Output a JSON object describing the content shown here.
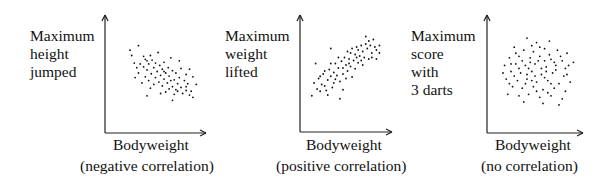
{
  "chart_data": [
    {
      "type": "scatter",
      "title": "",
      "ylabel": "Maximum height jumped",
      "ylabel_lines": [
        "Maximum",
        "height",
        "jumped"
      ],
      "xlabel": "Bodyweight",
      "caption": "(negative correlation)",
      "grid": false,
      "ticks": false,
      "trend": "negative",
      "points": [
        [
          0.3,
          0.86
        ],
        [
          0.53,
          0.77
        ],
        [
          0.22,
          0.73
        ],
        [
          0.38,
          0.68
        ],
        [
          0.46,
          0.67
        ],
        [
          0.6,
          0.64
        ],
        [
          0.25,
          0.63
        ],
        [
          0.32,
          0.62
        ],
        [
          0.42,
          0.62
        ],
        [
          0.55,
          0.6
        ],
        [
          0.65,
          0.57
        ],
        [
          0.8,
          0.56
        ],
        [
          0.28,
          0.57
        ],
        [
          0.36,
          0.58
        ],
        [
          0.48,
          0.57
        ],
        [
          0.58,
          0.55
        ],
        [
          0.7,
          0.53
        ],
        [
          0.4,
          0.54
        ],
        [
          0.52,
          0.52
        ],
        [
          0.62,
          0.5
        ],
        [
          0.74,
          0.5
        ],
        [
          0.86,
          0.48
        ],
        [
          0.3,
          0.5
        ],
        [
          0.45,
          0.49
        ],
        [
          0.56,
          0.47
        ],
        [
          0.66,
          0.46
        ],
        [
          0.78,
          0.44
        ],
        [
          0.38,
          0.45
        ],
        [
          0.5,
          0.44
        ],
        [
          0.6,
          0.42
        ],
        [
          0.72,
          0.41
        ],
        [
          0.84,
          0.4
        ],
        [
          0.42,
          0.4
        ],
        [
          0.54,
          0.38
        ],
        [
          0.64,
          0.37
        ],
        [
          0.76,
          0.36
        ],
        [
          0.88,
          0.36
        ],
        [
          0.48,
          0.35
        ],
        [
          0.58,
          0.33
        ],
        [
          0.7,
          0.32
        ],
        [
          0.8,
          0.31
        ],
        [
          0.66,
          0.29
        ],
        [
          0.74,
          0.28
        ],
        [
          0.86,
          0.27
        ],
        [
          0.92,
          0.26
        ],
        [
          0.62,
          0.25
        ],
        [
          0.82,
          0.23
        ],
        [
          0.72,
          0.22
        ],
        [
          0.9,
          0.21
        ],
        [
          0.56,
          0.23
        ],
        [
          0.44,
          0.3
        ],
        [
          0.34,
          0.37
        ],
        [
          0.26,
          0.44
        ],
        [
          0.98,
          0.35
        ],
        [
          0.94,
          0.45
        ],
        [
          0.9,
          0.55
        ],
        [
          0.78,
          0.66
        ],
        [
          0.68,
          0.7
        ],
        [
          0.2,
          0.8
        ],
        [
          0.4,
          0.2
        ],
        [
          0.7,
          0.14
        ],
        [
          0.36,
          0.72
        ],
        [
          0.44,
          0.73
        ],
        [
          0.5,
          0.63
        ],
        [
          0.68,
          0.4
        ],
        [
          0.76,
          0.26
        ],
        [
          0.6,
          0.52
        ],
        [
          0.86,
          0.32
        ],
        [
          0.94,
          0.18
        ],
        [
          0.4,
          0.66
        ]
      ]
    },
    {
      "type": "scatter",
      "title": "",
      "ylabel": "Maximum weight lifted",
      "ylabel_lines": [
        "Maximum",
        "weight",
        "lifted"
      ],
      "xlabel": "Bodyweight",
      "caption": "(positive correlation)",
      "grid": false,
      "ticks": false,
      "trend": "positive",
      "points": [
        [
          0.3,
          0.82
        ],
        [
          0.1,
          0.62
        ],
        [
          0.42,
          0.15
        ],
        [
          0.46,
          0.27
        ],
        [
          0.05,
          0.19
        ],
        [
          0.08,
          0.36
        ],
        [
          0.16,
          0.25
        ],
        [
          0.22,
          0.32
        ],
        [
          0.26,
          0.4
        ],
        [
          0.14,
          0.42
        ],
        [
          0.2,
          0.48
        ],
        [
          0.3,
          0.45
        ],
        [
          0.36,
          0.41
        ],
        [
          0.42,
          0.38
        ],
        [
          0.28,
          0.54
        ],
        [
          0.34,
          0.5
        ],
        [
          0.4,
          0.56
        ],
        [
          0.46,
          0.48
        ],
        [
          0.52,
          0.52
        ],
        [
          0.36,
          0.62
        ],
        [
          0.44,
          0.65
        ],
        [
          0.5,
          0.6
        ],
        [
          0.56,
          0.58
        ],
        [
          0.62,
          0.55
        ],
        [
          0.48,
          0.7
        ],
        [
          0.54,
          0.68
        ],
        [
          0.6,
          0.66
        ],
        [
          0.66,
          0.63
        ],
        [
          0.72,
          0.6
        ],
        [
          0.56,
          0.76
        ],
        [
          0.62,
          0.74
        ],
        [
          0.68,
          0.72
        ],
        [
          0.74,
          0.7
        ],
        [
          0.8,
          0.68
        ],
        [
          0.66,
          0.8
        ],
        [
          0.72,
          0.78
        ],
        [
          0.78,
          0.82
        ],
        [
          0.84,
          0.76
        ],
        [
          0.9,
          0.8
        ],
        [
          0.7,
          0.86
        ],
        [
          0.76,
          0.88
        ],
        [
          0.82,
          0.86
        ],
        [
          0.88,
          0.84
        ],
        [
          0.8,
          0.92
        ],
        [
          0.86,
          0.94
        ],
        [
          0.94,
          0.86
        ],
        [
          0.76,
          0.98
        ],
        [
          0.64,
          0.84
        ],
        [
          0.58,
          0.82
        ],
        [
          0.9,
          0.68
        ],
        [
          0.18,
          0.34
        ],
        [
          0.24,
          0.26
        ],
        [
          0.32,
          0.3
        ],
        [
          0.12,
          0.28
        ],
        [
          0.26,
          0.2
        ],
        [
          0.38,
          0.46
        ],
        [
          0.5,
          0.42
        ],
        [
          0.58,
          0.44
        ],
        [
          0.46,
          0.56
        ],
        [
          0.54,
          0.62
        ],
        [
          0.4,
          0.7
        ],
        [
          0.3,
          0.62
        ],
        [
          0.22,
          0.52
        ],
        [
          0.34,
          0.36
        ],
        [
          0.16,
          0.45
        ],
        [
          0.64,
          0.7
        ],
        [
          0.7,
          0.66
        ],
        [
          0.84,
          0.7
        ],
        [
          0.94,
          0.76
        ],
        [
          0.52,
          0.78
        ]
      ]
    },
    {
      "type": "scatter",
      "title": "",
      "ylabel": "Maximum score with 3 darts",
      "ylabel_lines": [
        "Maximum",
        "score",
        "with",
        "3 darts"
      ],
      "xlabel": "Bodyweight",
      "caption": "(no correlation)",
      "grid": false,
      "ticks": false,
      "trend": "none",
      "points": [
        [
          0.4,
          0.96
        ],
        [
          0.52,
          0.9
        ],
        [
          0.68,
          0.92
        ],
        [
          0.24,
          0.84
        ],
        [
          0.36,
          0.8
        ],
        [
          0.48,
          0.78
        ],
        [
          0.62,
          0.82
        ],
        [
          0.78,
          0.8
        ],
        [
          0.9,
          0.76
        ],
        [
          0.18,
          0.7
        ],
        [
          0.3,
          0.72
        ],
        [
          0.44,
          0.7
        ],
        [
          0.56,
          0.72
        ],
        [
          0.7,
          0.68
        ],
        [
          0.84,
          0.66
        ],
        [
          0.98,
          0.64
        ],
        [
          0.12,
          0.6
        ],
        [
          0.26,
          0.62
        ],
        [
          0.38,
          0.6
        ],
        [
          0.5,
          0.62
        ],
        [
          0.64,
          0.58
        ],
        [
          0.76,
          0.6
        ],
        [
          0.88,
          0.56
        ],
        [
          0.2,
          0.52
        ],
        [
          0.32,
          0.5
        ],
        [
          0.46,
          0.52
        ],
        [
          0.58,
          0.48
        ],
        [
          0.72,
          0.5
        ],
        [
          0.86,
          0.46
        ],
        [
          0.14,
          0.42
        ],
        [
          0.28,
          0.4
        ],
        [
          0.4,
          0.42
        ],
        [
          0.52,
          0.38
        ],
        [
          0.66,
          0.4
        ],
        [
          0.8,
          0.36
        ],
        [
          0.94,
          0.38
        ],
        [
          0.22,
          0.32
        ],
        [
          0.34,
          0.3
        ],
        [
          0.48,
          0.32
        ],
        [
          0.6,
          0.28
        ],
        [
          0.74,
          0.3
        ],
        [
          0.88,
          0.26
        ],
        [
          0.16,
          0.22
        ],
        [
          0.3,
          0.2
        ],
        [
          0.42,
          0.22
        ],
        [
          0.56,
          0.18
        ],
        [
          0.7,
          0.2
        ],
        [
          0.84,
          0.16
        ],
        [
          0.36,
          0.12
        ],
        [
          0.6,
          0.1
        ],
        [
          0.8,
          0.08
        ],
        [
          0.26,
          0.76
        ],
        [
          0.54,
          0.66
        ],
        [
          0.68,
          0.74
        ],
        [
          0.42,
          0.56
        ],
        [
          0.62,
          0.44
        ],
        [
          0.76,
          0.54
        ],
        [
          0.1,
          0.5
        ],
        [
          0.24,
          0.46
        ],
        [
          0.5,
          0.46
        ],
        [
          0.34,
          0.66
        ],
        [
          0.46,
          0.86
        ],
        [
          0.58,
          0.56
        ],
        [
          0.7,
          0.36
        ],
        [
          0.9,
          0.48
        ],
        [
          0.38,
          0.36
        ],
        [
          0.52,
          0.26
        ],
        [
          0.66,
          0.24
        ],
        [
          0.2,
          0.62
        ],
        [
          0.44,
          0.64
        ],
        [
          0.56,
          0.84
        ],
        [
          0.74,
          0.64
        ],
        [
          0.3,
          0.56
        ],
        [
          0.62,
          0.66
        ],
        [
          0.82,
          0.72
        ],
        [
          0.4,
          0.48
        ],
        [
          0.18,
          0.36
        ],
        [
          0.46,
          0.4
        ],
        [
          0.64,
          0.52
        ],
        [
          0.92,
          0.6
        ]
      ]
    }
  ],
  "panels": [
    {
      "ylabel_lines": [
        "Maximum",
        "height",
        "jumped"
      ],
      "xlabel": "Bodyweight",
      "caption": "(negative correlation)"
    },
    {
      "ylabel_lines": [
        "Maximum",
        "weight",
        "lifted"
      ],
      "xlabel": "Bodyweight",
      "caption": "(positive correlation)"
    },
    {
      "ylabel_lines": [
        "Maximum",
        "score",
        "with",
        "3 darts"
      ],
      "xlabel": "Bodyweight",
      "caption": "(no correlation)"
    }
  ]
}
